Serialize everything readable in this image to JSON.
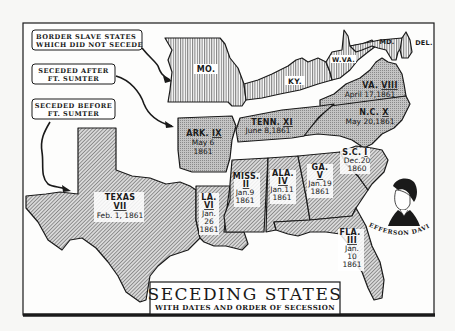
{
  "map": {
    "title": "SECEDING STATES",
    "subtitle": "WITH DATES AND ORDER OF SECESSION",
    "colors": {
      "background": "#f7f7f5",
      "ink": "#1a1a1a",
      "border_state_fill": "#ffffff",
      "after_sumter_fill": "#bdbdbd",
      "before_sumter_fill": "#c8c8c8"
    },
    "legend_callouts": [
      {
        "id": "border",
        "lines": [
          "BORDER SLAVE STATES",
          "WHICH DID NOT SECEDE"
        ],
        "pattern": "vertical-lines"
      },
      {
        "id": "after",
        "lines": [
          "SECEDED AFTER",
          "FT. SUMTER"
        ],
        "pattern": "stipple-gray"
      },
      {
        "id": "before",
        "lines": [
          "SECEDED BEFORE",
          "FT. SUMTER"
        ],
        "pattern": "diagonal-hatch"
      }
    ],
    "border_states": [
      {
        "abbr": "MO."
      },
      {
        "abbr": "KY."
      },
      {
        "abbr": "W.VA."
      },
      {
        "abbr": "MD."
      },
      {
        "abbr": "DEL."
      }
    ],
    "after_sumter_states": [
      {
        "abbr": "ARK.",
        "order": "IX",
        "date_lines": [
          "May 6",
          "1861"
        ]
      },
      {
        "abbr": "TENN.",
        "order": "XI",
        "date_lines": [
          "June 8,1861"
        ]
      },
      {
        "abbr": "VA.",
        "order": "VIII",
        "date_lines": [
          "April 17,1861"
        ]
      },
      {
        "abbr": "N.C.",
        "order": "X",
        "date_lines": [
          "May 20,1861"
        ]
      }
    ],
    "before_sumter_states": [
      {
        "abbr": "TEXAS",
        "order": "VII",
        "date_lines": [
          "Feb. 1, 1861"
        ]
      },
      {
        "abbr": "LA.",
        "order": "VI",
        "date_lines": [
          "Jan.",
          "26",
          "1861"
        ]
      },
      {
        "abbr": "MISS.",
        "order": "II",
        "date_lines": [
          "Jan.9",
          "1861"
        ]
      },
      {
        "abbr": "ALA.",
        "order": "IV",
        "date_lines": [
          "Jan.11",
          "1861"
        ]
      },
      {
        "abbr": "GA.",
        "order": "V",
        "date_lines": [
          "Jan.19",
          "1861"
        ]
      },
      {
        "abbr": "S.C.",
        "order": "I",
        "date_lines": [
          "Dec.20",
          "1860"
        ]
      },
      {
        "abbr": "FLA.",
        "order": "III",
        "date_lines": [
          "Jan.",
          "10",
          "1861"
        ]
      }
    ],
    "portrait": {
      "caption": "JEFFERSON DAVIS"
    }
  }
}
